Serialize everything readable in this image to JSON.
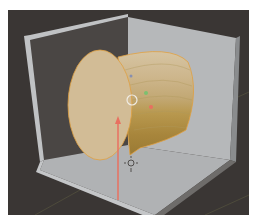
{
  "viewport": {
    "label": "3D Viewport",
    "background_color": "#3a3634",
    "grid_line_color": "#5a5840"
  },
  "scene": {
    "room": {
      "name": "open-box",
      "back_left_wall_color": "#4a4644",
      "back_right_wall_color": "#b4b6b8",
      "floor_color": "#b0b2b4",
      "edge_color": "#c6c8ca"
    },
    "selected_object": {
      "name": "cylinder",
      "cap_color": "#d2bc96",
      "side_light_color": "#c8ae80",
      "side_dark_color": "#a8863c",
      "outline_color": "#e0a040"
    },
    "gizmos": {
      "cursor_3d": {
        "name": "3d-cursor",
        "color": "#f0ece4"
      },
      "x_axis": {
        "color": "#e87060"
      },
      "y_axis": {
        "color": "#7cc070"
      },
      "z_axis": {
        "color": "#8890b0"
      },
      "light_icon": {
        "name": "light-gizmo",
        "color": "#3a3634"
      }
    }
  }
}
